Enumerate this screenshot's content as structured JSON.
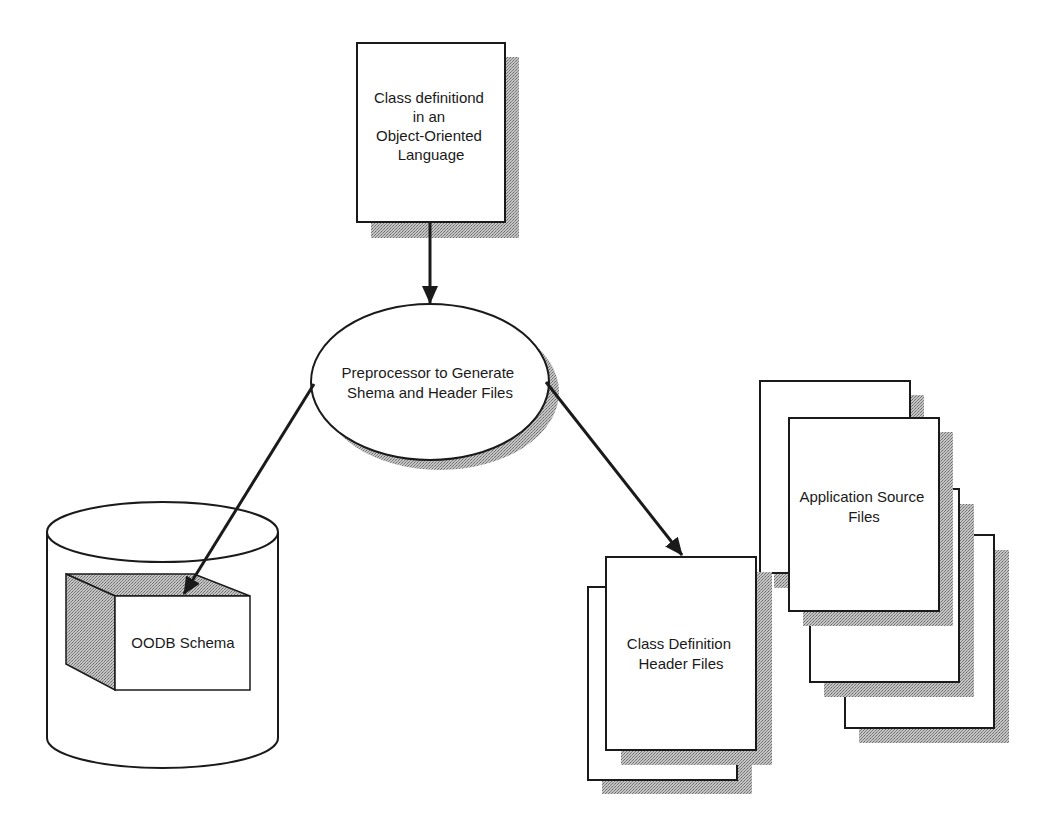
{
  "diagram": {
    "type": "flow",
    "colors": {
      "stroke": "#1a1a1a",
      "shadow": "#9a9a9a",
      "fill": "#ffffff"
    },
    "nodes": {
      "source": {
        "shape": "document",
        "lines": [
          "Class definitiond",
          "in an",
          "Object-Oriented",
          "Language"
        ]
      },
      "preprocessor": {
        "shape": "ellipse",
        "lines": [
          "Preprocessor to Generate",
          "Shema and Header Files"
        ]
      },
      "schema": {
        "shape": "database-cylinder-with-cube",
        "lines": [
          "OODB Schema"
        ]
      },
      "headers": {
        "shape": "document-stack",
        "lines": [
          "Class Definition",
          "Header Files"
        ]
      },
      "app_sources": {
        "shape": "document-stack",
        "lines": [
          "Application Source",
          "Files"
        ]
      }
    },
    "edges": [
      {
        "from": "source",
        "to": "preprocessor"
      },
      {
        "from": "preprocessor",
        "to": "schema"
      },
      {
        "from": "preprocessor",
        "to": "headers"
      }
    ]
  }
}
